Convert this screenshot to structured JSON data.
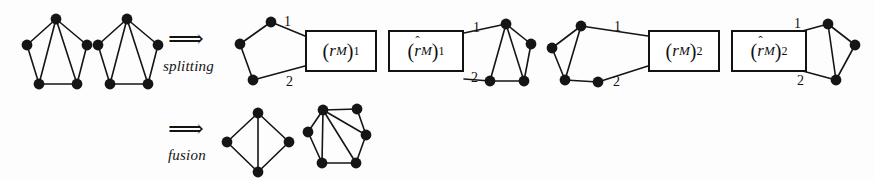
{
  "figure": {
    "background_color": "#fdfdfd",
    "ink_color": "#151515",
    "width": 875,
    "height": 181
  },
  "operations": [
    {
      "name": "splitting",
      "label": "splitting",
      "arrow": "⟹"
    },
    {
      "name": "fusion",
      "label": "fusion",
      "arrow": "⟹"
    }
  ],
  "boxes": [
    {
      "name": "box-rm-1",
      "open": "(",
      "symbol": "r",
      "hat": false,
      "sub": "M",
      "close": ")",
      "index": "1",
      "text": "(r_M)_1"
    },
    {
      "name": "box-rhat-m-1",
      "open": "(",
      "symbol": "r",
      "hat": true,
      "sub": "M",
      "close": ")",
      "index": "1",
      "text": "(r̂_M)_1"
    },
    {
      "name": "box-rm-2",
      "open": "(",
      "symbol": "r",
      "hat": false,
      "sub": "M",
      "close": ")",
      "index": "2",
      "text": "(r_M)_2"
    },
    {
      "name": "box-rhat-m-2",
      "open": "(",
      "symbol": "r",
      "hat": true,
      "sub": "M",
      "close": ")",
      "index": "2",
      "text": "(r̂_M)_2"
    }
  ],
  "edge_labels": [
    {
      "name": "edge-label-1a",
      "text": "1",
      "x": 284,
      "y": 14
    },
    {
      "name": "edge-label-2a",
      "text": "2",
      "x": 286,
      "y": 74
    },
    {
      "name": "edge-label-1b",
      "text": "1",
      "x": 473,
      "y": 20
    },
    {
      "name": "edge-label-2b",
      "text": "2",
      "x": 471,
      "y": 70
    },
    {
      "name": "edge-label-1c",
      "text": "1",
      "x": 614,
      "y": 19
    },
    {
      "name": "edge-label-2c",
      "text": "2",
      "x": 613,
      "y": 74
    },
    {
      "name": "edge-label-1d",
      "text": "1",
      "x": 794,
      "y": 16
    },
    {
      "name": "edge-label-2d",
      "text": "2",
      "x": 797,
      "y": 73
    }
  ],
  "graphs": [
    {
      "name": "graph-m-left",
      "role": "input-component-1",
      "vertices": [
        {
          "id": "a",
          "x": 56,
          "y": 19
        },
        {
          "id": "b",
          "x": 27,
          "y": 45
        },
        {
          "id": "c",
          "x": 87,
          "y": 45
        },
        {
          "id": "d",
          "x": 39,
          "y": 84
        },
        {
          "id": "e",
          "x": 77,
          "y": 84
        }
      ],
      "edges": [
        [
          "a",
          "b"
        ],
        [
          "a",
          "c"
        ],
        [
          "a",
          "d"
        ],
        [
          "a",
          "e"
        ],
        [
          "b",
          "d"
        ],
        [
          "c",
          "e"
        ],
        [
          "d",
          "e"
        ]
      ]
    },
    {
      "name": "graph-m-right",
      "role": "input-component-2",
      "vertices": [
        {
          "id": "a",
          "x": 127,
          "y": 19
        },
        {
          "id": "b",
          "x": 98,
          "y": 45
        },
        {
          "id": "c",
          "x": 158,
          "y": 45
        },
        {
          "id": "d",
          "x": 110,
          "y": 84
        },
        {
          "id": "e",
          "x": 148,
          "y": 84
        }
      ],
      "edges": [
        [
          "a",
          "b"
        ],
        [
          "a",
          "c"
        ],
        [
          "a",
          "d"
        ],
        [
          "a",
          "e"
        ],
        [
          "b",
          "d"
        ],
        [
          "c",
          "e"
        ],
        [
          "d",
          "e"
        ]
      ]
    },
    {
      "name": "graph-split-frag-1",
      "role": "split-fragment-left-of-box-1",
      "vertices": [
        {
          "id": "p",
          "x": 271,
          "y": 22
        },
        {
          "id": "q",
          "x": 240,
          "y": 44
        },
        {
          "id": "r",
          "x": 253,
          "y": 80
        }
      ],
      "edges": [
        [
          "p",
          "q"
        ],
        [
          "q",
          "r"
        ]
      ],
      "terminals": [
        {
          "from": "p",
          "to_x": 305,
          "to_y": 36,
          "label": "1"
        },
        {
          "from": "r",
          "to_x": 305,
          "to_y": 66,
          "label": "2"
        }
      ]
    },
    {
      "name": "graph-split-frag-2",
      "role": "split-fragment-right-of-box-2",
      "vertices": [
        {
          "id": "a",
          "x": 506,
          "y": 24
        },
        {
          "id": "b",
          "x": 531,
          "y": 44
        },
        {
          "id": "c",
          "x": 490,
          "y": 81
        },
        {
          "id": "d",
          "x": 524,
          "y": 81
        }
      ],
      "edges": [
        [
          "a",
          "b"
        ],
        [
          "a",
          "c"
        ],
        [
          "a",
          "d"
        ],
        [
          "b",
          "d"
        ],
        [
          "c",
          "d"
        ]
      ],
      "terminals": [
        {
          "from": "a",
          "to_x": 464,
          "to_y": 33,
          "label": "1"
        },
        {
          "from": "c",
          "to_x": 464,
          "to_y": 79,
          "label": "2"
        }
      ]
    },
    {
      "name": "graph-split-frag-3",
      "role": "split-fragment-left-of-box-3",
      "vertices": [
        {
          "id": "a",
          "x": 581,
          "y": 26
        },
        {
          "id": "b",
          "x": 552,
          "y": 48
        },
        {
          "id": "c",
          "x": 565,
          "y": 80
        },
        {
          "id": "d",
          "x": 598,
          "y": 82
        }
      ],
      "edges": [
        [
          "a",
          "b"
        ],
        [
          "a",
          "c"
        ],
        [
          "b",
          "c"
        ],
        [
          "c",
          "d"
        ]
      ],
      "terminals": [
        {
          "from": "a",
          "to_x": 648,
          "to_y": 36,
          "label": "1"
        },
        {
          "from": "d",
          "to_x": 648,
          "to_y": 66,
          "label": "2"
        }
      ]
    },
    {
      "name": "graph-split-frag-4",
      "role": "split-fragment-right-of-box-4",
      "vertices": [
        {
          "id": "a",
          "x": 828,
          "y": 24
        },
        {
          "id": "b",
          "x": 855,
          "y": 45
        },
        {
          "id": "c",
          "x": 836,
          "y": 80
        }
      ],
      "edges": [
        [
          "a",
          "b"
        ],
        [
          "a",
          "c"
        ],
        [
          "b",
          "c"
        ]
      ],
      "terminals": [
        {
          "from": "a",
          "to_x": 784,
          "to_y": 36,
          "label": "1"
        },
        {
          "from": "c",
          "to_x": 784,
          "to_y": 66,
          "label": "2"
        }
      ]
    },
    {
      "name": "graph-fusion-result-1",
      "role": "fusion-output-1",
      "vertices": [
        {
          "id": "t",
          "x": 258,
          "y": 113
        },
        {
          "id": "l",
          "x": 227,
          "y": 142
        },
        {
          "id": "r",
          "x": 289,
          "y": 142
        },
        {
          "id": "b",
          "x": 258,
          "y": 172
        }
      ],
      "edges": [
        [
          "t",
          "l"
        ],
        [
          "t",
          "r"
        ],
        [
          "t",
          "b"
        ],
        [
          "l",
          "b"
        ],
        [
          "r",
          "b"
        ]
      ]
    },
    {
      "name": "graph-fusion-result-2",
      "role": "fusion-output-2",
      "vertices": [
        {
          "id": "a",
          "x": 323,
          "y": 110
        },
        {
          "id": "b",
          "x": 357,
          "y": 109
        },
        {
          "id": "c",
          "x": 308,
          "y": 132
        },
        {
          "id": "d",
          "x": 366,
          "y": 135
        },
        {
          "id": "e",
          "x": 322,
          "y": 163
        },
        {
          "id": "f",
          "x": 356,
          "y": 163
        }
      ],
      "edges": [
        [
          "a",
          "b"
        ],
        [
          "a",
          "c"
        ],
        [
          "a",
          "d"
        ],
        [
          "a",
          "e"
        ],
        [
          "a",
          "f"
        ],
        [
          "b",
          "d"
        ],
        [
          "c",
          "e"
        ],
        [
          "d",
          "f"
        ],
        [
          "e",
          "f"
        ]
      ]
    }
  ]
}
